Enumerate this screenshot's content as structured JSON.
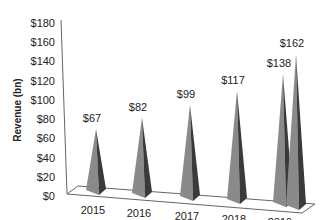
{
  "chart_data": {
    "type": "bar",
    "style": "3d-pyramid",
    "title": "",
    "xlabel": "",
    "ylabel": "Revenue (bn)",
    "categories": [
      "2015",
      "2016",
      "2017",
      "2018",
      "2019",
      "2020"
    ],
    "values": [
      67,
      82,
      99,
      117,
      138,
      162
    ],
    "data_labels": [
      "$67",
      "$82",
      "$99",
      "$117",
      "$138",
      "$162"
    ],
    "yticks": [
      "$0",
      "$20",
      "$40",
      "$60",
      "$80",
      "$100",
      "$120",
      "$140",
      "$160",
      "$180"
    ],
    "ylim": [
      0,
      180
    ],
    "grid": false,
    "legend": "none",
    "colors": {
      "pyramid_light": "#8a8a8a",
      "pyramid_dark": "#3a3a3a",
      "axis": "#666666"
    }
  }
}
